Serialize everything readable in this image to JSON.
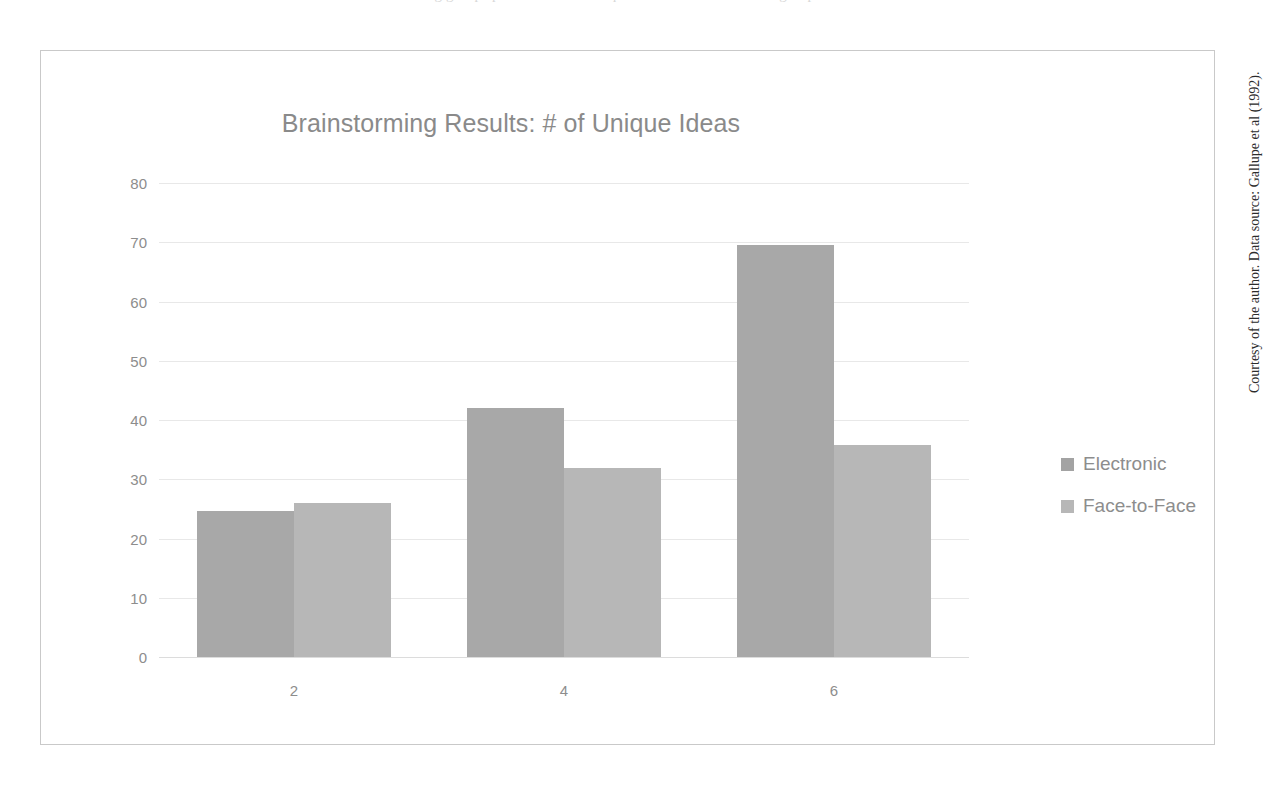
{
  "page": {
    "top_cutoff_text": "brainstorming groups produced more unique ideas than face-to-face groups of the same size.",
    "credit": "Courtesy of the author. Data source: Gallupe et al (1992)."
  },
  "legend": {
    "position": "right",
    "entries": [
      {
        "label": "Electronic",
        "color": "#a8a8a8",
        "swatch_icon": "legend-square-icon"
      },
      {
        "label": "Face-to-Face",
        "color": "#b7b7b7",
        "swatch_icon": "legend-square-icon"
      }
    ]
  },
  "axes": {
    "y_ticks": [
      "80",
      "70",
      "60",
      "50",
      "40",
      "30",
      "20",
      "10",
      "0"
    ],
    "x_ticks": [
      "2",
      "4",
      "6"
    ]
  },
  "chart_data": {
    "type": "bar",
    "title": "Brainstorming Results: # of Unique Ideas",
    "xlabel": "",
    "ylabel": "",
    "categories": [
      "2",
      "4",
      "6"
    ],
    "series": [
      {
        "name": "Electronic",
        "color": "#a8a8a8",
        "values": [
          24.6,
          42.0,
          69.5
        ]
      },
      {
        "name": "Face-to-Face",
        "color": "#b7b7b7",
        "values": [
          26.0,
          31.9,
          35.7
        ]
      }
    ],
    "ylim": [
      0,
      80
    ],
    "ytick_step": 10,
    "grid": true,
    "legend_position": "right"
  }
}
